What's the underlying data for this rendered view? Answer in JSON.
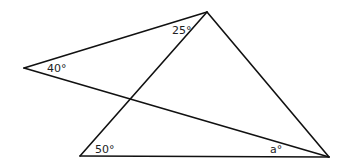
{
  "figure": {
    "points": {
      "apex": [
        207,
        12
      ],
      "left": [
        24,
        68
      ],
      "bottom_left": [
        80,
        156
      ],
      "bottom_right": [
        329,
        157
      ]
    },
    "line_color": "#111111",
    "angles": {
      "top": "25°",
      "left": "40°",
      "bottom_left": "50°",
      "bottom_right": "a°"
    }
  }
}
